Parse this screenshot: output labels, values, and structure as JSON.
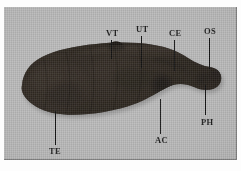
{
  "figure": {
    "type": "specimen-photograph",
    "background_color": "#b6b6b6",
    "specimen_color": "#241f1b",
    "margin_color": "#fdfdfd",
    "label_color": "#141414"
  },
  "labels": [
    {
      "id": "vt",
      "text": "VT",
      "name": "ventral-tubercle",
      "position": "top",
      "x": 106,
      "y": 30,
      "leader_x": 111,
      "leader_top": 40,
      "leader_height": 19
    },
    {
      "id": "ut",
      "text": "UT",
      "name": "uterus",
      "position": "top",
      "x": 136,
      "y": 26,
      "leader_x": 141,
      "leader_top": 36,
      "leader_height": 32
    },
    {
      "id": "ce",
      "text": "CE",
      "name": "cecum",
      "position": "top",
      "x": 169,
      "y": 30,
      "leader_x": 174,
      "leader_top": 40,
      "leader_height": 31
    },
    {
      "id": "os",
      "text": "OS",
      "name": "oral-sucker",
      "position": "top",
      "x": 205,
      "y": 28,
      "leader_x": 209,
      "leader_top": 38,
      "leader_height": 31
    },
    {
      "id": "te",
      "text": "TE",
      "name": "testis",
      "position": "bottom",
      "x": 49,
      "y": 148,
      "leader_x": 55,
      "leader_top": 111,
      "leader_height": 34
    },
    {
      "id": "ac",
      "text": "AC",
      "name": "acetabulum",
      "position": "bottom",
      "x": 155,
      "y": 137,
      "leader_x": 160,
      "leader_top": 99,
      "leader_height": 35
    },
    {
      "id": "ph",
      "text": "PH",
      "name": "pharynx",
      "position": "bottom",
      "x": 201,
      "y": 119,
      "leader_x": 205,
      "leader_top": 85,
      "leader_height": 30
    }
  ]
}
